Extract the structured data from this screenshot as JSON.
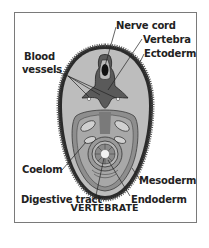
{
  "figure": {
    "caption": "VERTEBRATE",
    "labels": {
      "nerve_cord": "Nerve cord",
      "vertebra": "Vertebra",
      "ectoderm": "Ectoderm",
      "blood_vessels_line1": "Blood",
      "blood_vessels_line2": "vessels",
      "coelom": "Coelom",
      "mesoderm": "Mesoderm",
      "digestive_tract": "Digestive tract",
      "endoderm": "Endoderm"
    },
    "colors": {
      "ectoderm": "#2a2a2a",
      "mesoderm_fill": "#b8b8b8",
      "coelom_fill": "#8c8c8c",
      "gut_fill": "#a0a0a0",
      "lumen": "#f2f2f2",
      "frame": "#7a7a7a"
    }
  }
}
